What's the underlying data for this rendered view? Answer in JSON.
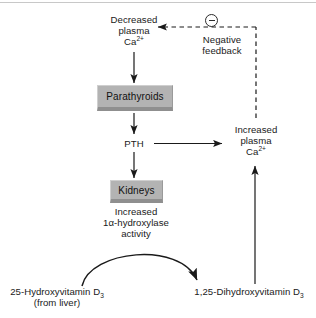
{
  "diagram": {
    "colors": {
      "box_fill": "#b3b3b3",
      "box_shadow": "#8f8f8f",
      "stroke": "#1a1a1a",
      "text": "#1a1a1a",
      "top_rule": "#c8c8c8"
    },
    "nodes": {
      "decreased_ca": {
        "line1": "Decreased",
        "line2": "plasma",
        "line3_prefix": "Ca",
        "line3_sup": "2+"
      },
      "parathyroids": {
        "label": "Parathyroids"
      },
      "pth": {
        "label": "PTH"
      },
      "kidneys": {
        "label": "Kidneys"
      },
      "hydroxylase": {
        "line1": "Increased",
        "line2": "1α-hydroxylase",
        "line3": "activity"
      },
      "increased_ca": {
        "line1": "Increased",
        "line2": "plasma",
        "line3_prefix": "Ca",
        "line3_sup": "2+"
      },
      "vit_d_25oh": {
        "line1_prefix": "25-Hydroxyvitamin D",
        "line1_sub": "3",
        "line2": "(from liver)"
      },
      "vit_d_125": {
        "line1_prefix": "1,25-Dihydroxyvitamin D",
        "line1_sub": "3"
      },
      "negative_feedback": {
        "line1": "Negative",
        "line2": "feedback"
      },
      "minus_sign": {
        "symbol": "−"
      }
    },
    "edges": [
      {
        "name": "decreased-ca-to-parathyroids",
        "style": "solid",
        "direction": "down"
      },
      {
        "name": "parathyroids-to-pth",
        "style": "solid",
        "direction": "down"
      },
      {
        "name": "pth-to-increased-ca",
        "style": "solid",
        "direction": "right"
      },
      {
        "name": "pth-to-kidneys",
        "style": "solid",
        "direction": "down"
      },
      {
        "name": "25ohd-to-125d-conversion",
        "style": "solid-curved",
        "direction": "right"
      },
      {
        "name": "125d-to-increased-ca",
        "style": "solid",
        "direction": "up"
      },
      {
        "name": "increased-ca-negative-feedback",
        "style": "dashed",
        "direction": "left"
      }
    ]
  }
}
